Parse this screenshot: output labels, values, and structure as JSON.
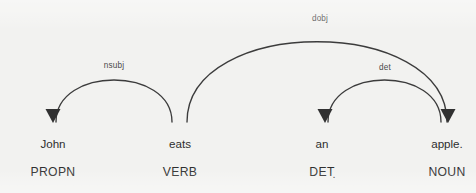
{
  "visualization": {
    "kind": "dependency-parse",
    "sentence": "John eats an apple.",
    "background_color": "#f2f2f0",
    "stroke_color": "#3c3c3c",
    "text_color": "#2e2e2e",
    "label_color": "#4a4a4a"
  },
  "words": [
    {
      "text": "John",
      "pos": "PROPN",
      "x": 53,
      "word_y": 148,
      "pos_y": 176
    },
    {
      "text": "eats",
      "pos": "VERB",
      "x": 180,
      "word_y": 148,
      "pos_y": 176
    },
    {
      "text": "an",
      "pos": "DET",
      "x": 322,
      "word_y": 148,
      "pos_y": 176
    },
    {
      "text": "apple.",
      "pos": "NOUN",
      "x": 447,
      "word_y": 148,
      "pos_y": 176
    }
  ],
  "extra_marks": [
    {
      "text": ".",
      "x": 334,
      "y": 178,
      "name": "det-trailing-period"
    }
  ],
  "arcs": [
    {
      "label": "nsubj",
      "head_word": "eats",
      "child_word": "John",
      "direction": "left",
      "path": "M 56 122 C 56 66, 172 66, 172 122",
      "label_x": 114,
      "label_y": 68,
      "arrow_x": 53,
      "arrow_y": 122
    },
    {
      "label": "dobj",
      "head_word": "eats",
      "child_word": "apple.",
      "direction": "right",
      "path": "M 187 122 C 187 15, 447 15, 447 122",
      "label_x": 320,
      "label_y": 21,
      "arrow_x": 448,
      "arrow_y": 122
    },
    {
      "label": "det",
      "head_word": "apple.",
      "child_word": "an",
      "direction": "left",
      "path": "M 328 122 C 328 66, 441 66, 441 122",
      "label_x": 385,
      "label_y": 70,
      "arrow_x": 325,
      "arrow_y": 122
    }
  ]
}
